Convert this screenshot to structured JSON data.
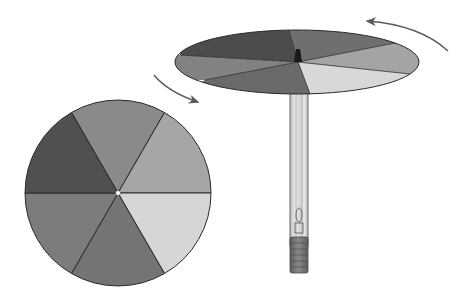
{
  "diagram": {
    "flat_wheel": {
      "segments": 6,
      "colors": [
        "#8a8a8a",
        "#a6a6a6",
        "#d6d6d6",
        "#747474",
        "#7c7c7c",
        "#505050"
      ],
      "center_dot": "#ffffff"
    },
    "spinning_wheel": {
      "segments": 6,
      "colors": [
        "#6f6f6f",
        "#a4a4a4",
        "#d8d8d8",
        "#6a6a6a",
        "#828282",
        "#4c4c4c"
      ]
    },
    "arrows": [
      {
        "name": "rotation-arrow-left",
        "direction": "clockwise"
      },
      {
        "name": "rotation-arrow-right",
        "direction": "counterclockwise"
      }
    ],
    "pencil": {
      "body_color": "#dcdcdc",
      "eraser_color": "#6e6e6e",
      "tip_color": "#1a1a1a"
    },
    "stroke": "#2a2a2a",
    "arrow_color": "#5a5a5a"
  }
}
